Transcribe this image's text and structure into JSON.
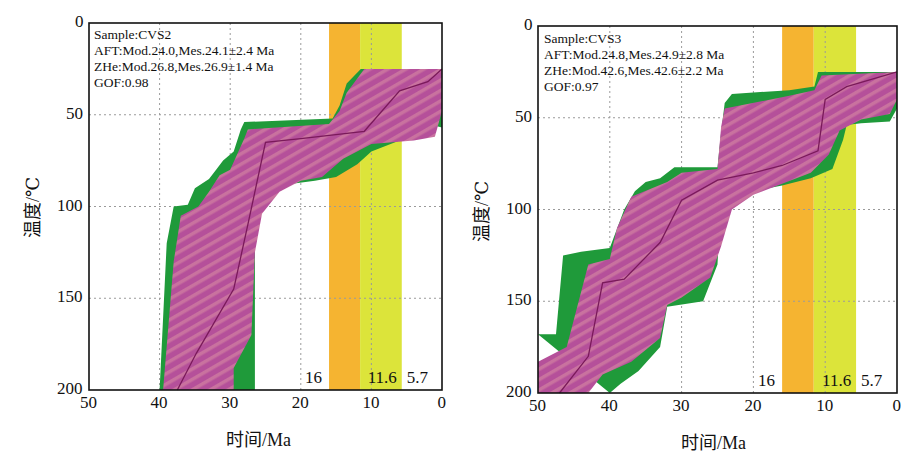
{
  "chart_data": [
    {
      "type": "area",
      "title": "",
      "sample": "Sample:CVS2",
      "annotations": [
        "Sample:CVS2",
        "AFT:Mod.24.0,Mes.24.1±2.4 Ma",
        "ZHe:Mod.26.8,Mes.26.9±1.4 Ma",
        "GOF:0.98"
      ],
      "xlabel": "时间/Ma",
      "ylabel": "温度/℃",
      "xlim": [
        50,
        0
      ],
      "ylim": [
        200,
        0
      ],
      "xticks": [
        "50",
        "40",
        "30",
        "20",
        "10",
        "0"
      ],
      "yticks": [
        "0",
        "50",
        "100",
        "150",
        "200"
      ],
      "grid": true,
      "bands": [
        {
          "from": 16,
          "to": 11.6,
          "color": "#f5b431"
        },
        {
          "from": 11.6,
          "to": 5.7,
          "color": "#dce43a"
        }
      ],
      "band_labels": [
        "16",
        "11.6",
        "5.7"
      ],
      "series": [
        {
          "name": "good-fit envelope (green)",
          "color": "#1f9a3a",
          "upper": [
            [
              40,
              200
            ],
            [
              39,
              120
            ],
            [
              38,
              100
            ],
            [
              36,
              99
            ],
            [
              35,
              90
            ],
            [
              33,
              85
            ],
            [
              32,
              80
            ],
            [
              31,
              75
            ],
            [
              29.5,
              70
            ],
            [
              28.5,
              58
            ],
            [
              28,
              54
            ],
            [
              15.5,
              52
            ],
            [
              14.5,
              45
            ],
            [
              13.5,
              33
            ],
            [
              11.5,
              25
            ],
            [
              0,
              25
            ]
          ],
          "lower": [
            [
              0,
              57
            ],
            [
              1,
              56
            ],
            [
              3,
              62
            ],
            [
              6,
              64
            ],
            [
              10,
              70
            ],
            [
              12,
              77
            ],
            [
              15,
              84
            ],
            [
              18,
              86
            ],
            [
              22,
              88
            ],
            [
              24.5,
              96
            ],
            [
              26,
              104
            ],
            [
              26.5,
              120
            ],
            [
              26.5,
              200
            ]
          ]
        },
        {
          "name": "acceptable-fit envelope (magenta)",
          "color": "#b5509a",
          "upper": [
            [
              39.5,
              200
            ],
            [
              38,
              130
            ],
            [
              37,
              105
            ],
            [
              34.5,
              100
            ],
            [
              33,
              92
            ],
            [
              31.5,
              83
            ],
            [
              30,
              80
            ],
            [
              28,
              63
            ],
            [
              27.5,
              58
            ],
            [
              16,
              55
            ],
            [
              14.5,
              48
            ],
            [
              13.5,
              38
            ],
            [
              11,
              25
            ],
            [
              0,
              25
            ]
          ],
          "lower": [
            [
              0,
              48
            ],
            [
              1,
              62
            ],
            [
              4,
              64
            ],
            [
              10,
              66
            ],
            [
              14,
              74
            ],
            [
              17,
              84
            ],
            [
              20,
              86
            ],
            [
              23,
              92
            ],
            [
              25.5,
              104
            ],
            [
              26.5,
              125
            ],
            [
              27,
              170
            ],
            [
              29.5,
              188
            ],
            [
              29.5,
              200
            ]
          ]
        },
        {
          "name": "best-fit path",
          "color": "#7a1a5a",
          "points": [
            [
              37.5,
              200
            ],
            [
              34.8,
              180
            ],
            [
              29.5,
              145
            ],
            [
              27.5,
              110
            ],
            [
              25,
              65
            ],
            [
              20,
              63
            ],
            [
              11,
              59
            ],
            [
              6,
              37
            ],
            [
              2,
              32
            ],
            [
              0,
              25
            ]
          ]
        }
      ]
    },
    {
      "type": "area",
      "title": "",
      "sample": "Sample:CVS3",
      "annotations": [
        "Sample:CVS3",
        "AFT:Mod.24.8,Mes.24.9±2.8 Ma",
        "ZHe:Mod.42.6,Mes.42.6±2.2 Ma",
        "GOF:0.97"
      ],
      "xlabel": "时间/Ma",
      "ylabel": "温度/℃",
      "xlim": [
        50,
        0
      ],
      "ylim": [
        200,
        0
      ],
      "xticks": [
        "50",
        "40",
        "30",
        "20",
        "10",
        "0"
      ],
      "yticks": [
        "0",
        "50",
        "100",
        "150",
        "200"
      ],
      "grid": true,
      "bands": [
        {
          "from": 16,
          "to": 11.6,
          "color": "#f5b431"
        },
        {
          "from": 11.6,
          "to": 5.7,
          "color": "#dce43a"
        }
      ],
      "band_labels": [
        "16",
        "11.6",
        "5.7"
      ],
      "series": [
        {
          "name": "good-fit envelope (green)",
          "color": "#1f9a3a",
          "upper": [
            [
              50,
              168
            ],
            [
              47.5,
              168
            ],
            [
              46.5,
              125
            ],
            [
              44,
              123
            ],
            [
              40,
              121
            ],
            [
              38,
              100
            ],
            [
              36.5,
              90
            ],
            [
              35,
              85
            ],
            [
              33,
              83
            ],
            [
              31,
              77
            ],
            [
              25,
              77
            ],
            [
              24.5,
              58
            ],
            [
              24,
              42
            ],
            [
              23,
              37
            ],
            [
              15,
              35
            ],
            [
              11.5,
              33
            ],
            [
              11,
              25
            ],
            [
              0,
              25
            ]
          ],
          "lower": [
            [
              0,
              45
            ],
            [
              1,
              52
            ],
            [
              5,
              53
            ],
            [
              7,
              54
            ],
            [
              7.5,
              62
            ],
            [
              9,
              78
            ],
            [
              12,
              83
            ],
            [
              16,
              87
            ],
            [
              20,
              90
            ],
            [
              22,
              95
            ],
            [
              24,
              103
            ],
            [
              24.8,
              115
            ],
            [
              25,
              130
            ],
            [
              27,
              150
            ],
            [
              32,
              153
            ],
            [
              33,
              175
            ],
            [
              36,
              188
            ],
            [
              38.5,
              195
            ],
            [
              40,
              200
            ]
          ]
        },
        {
          "name": "acceptable-fit envelope (magenta)",
          "color": "#b5509a",
          "upper": [
            [
              50,
              183
            ],
            [
              46,
              175
            ],
            [
              45,
              160
            ],
            [
              43,
              130
            ],
            [
              40,
              127
            ],
            [
              39,
              110
            ],
            [
              37,
              93
            ],
            [
              32,
              85
            ],
            [
              30,
              80
            ],
            [
              25,
              78
            ],
            [
              24.5,
              55
            ],
            [
              24,
              45
            ],
            [
              15,
              38
            ],
            [
              11.5,
              35
            ],
            [
              10.5,
              27
            ],
            [
              0,
              25
            ]
          ],
          "lower": [
            [
              0,
              40
            ],
            [
              1,
              48
            ],
            [
              5,
              51
            ],
            [
              8,
              57
            ],
            [
              9.5,
              70
            ],
            [
              12,
              80
            ],
            [
              16,
              86
            ],
            [
              20,
              92
            ],
            [
              23,
              100
            ],
            [
              24.5,
              120
            ],
            [
              26,
              137
            ],
            [
              30,
              148
            ],
            [
              32,
              152
            ],
            [
              33,
              170
            ],
            [
              37,
              183
            ],
            [
              41,
              190
            ],
            [
              43,
              200
            ],
            [
              50,
              200
            ]
          ]
        },
        {
          "name": "best-fit path",
          "color": "#7a1a5a",
          "points": [
            [
              47,
              200
            ],
            [
              43,
              180
            ],
            [
              41,
              140
            ],
            [
              38,
              138
            ],
            [
              33,
              118
            ],
            [
              30,
              95
            ],
            [
              25,
              84
            ],
            [
              20,
              80
            ],
            [
              16,
              76
            ],
            [
              11,
              68
            ],
            [
              10,
              40
            ],
            [
              7,
              33
            ],
            [
              0,
              25
            ]
          ]
        }
      ]
    }
  ]
}
